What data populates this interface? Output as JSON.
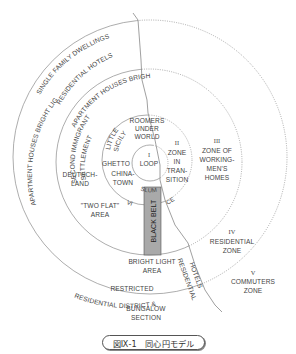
{
  "figure": {
    "caption": "図Ⅸ-1　同心円モデル"
  },
  "zones": [
    {
      "numeral": "I",
      "lines": [
        "LOOP"
      ]
    },
    {
      "numeral": "II",
      "lines": [
        "ZONE",
        "IN",
        "TRAN-",
        "SITION"
      ]
    },
    {
      "numeral": "III",
      "lines": [
        "ZONE OF",
        "WORKING-",
        "MEN'S",
        "HOMES"
      ]
    },
    {
      "numeral": "IV",
      "lines": [
        "RESIDENTIAL",
        "ZONE"
      ]
    },
    {
      "numeral": "V",
      "lines": [
        "COMMUTERS",
        "ZONE"
      ]
    }
  ],
  "areas": {
    "roomers": [
      "ROOMERS",
      "UNDER",
      "WORLD"
    ],
    "little_sicily": [
      "LITTLE",
      "SICILY"
    ],
    "ghetto": "GHETTO",
    "chinatown": [
      "CHINA-",
      "TOWN"
    ],
    "slum": "SLUM",
    "vice": "VI",
    "ce": "CE",
    "black_belt": "BLACK BELT",
    "deutschland": [
      "DEUTSCH-",
      "LAND"
    ],
    "two_flat": [
      "\"TWO FLAT\"",
      "AREA"
    ],
    "second_immigrant": [
      "SECOND IMMIGRANT",
      "SETTLEMENT"
    ],
    "apartment_houses": "APARTMENT HOUSES BRIGHT LIGHT AREA",
    "residential_hotels": "RESIDENTIAL HOTELS",
    "single_family": "SINGLE FAMILY DWELLINGS",
    "bright_light": [
      "BRIGHT LIGHT",
      "AREA"
    ],
    "restricted": [
      "RESTRICTED",
      "RESIDENTIAL DISTRICT &"
    ],
    "residential_hotels_2": [
      "RESIDENTIAL",
      "HOTELS"
    ],
    "bungalow": [
      "BUNGALOW",
      "SECTION"
    ]
  },
  "colors": {
    "line": "#888888",
    "text": "#444444",
    "black_belt_fill": "#a9a9a9",
    "black_belt_stroke": "#555555"
  }
}
